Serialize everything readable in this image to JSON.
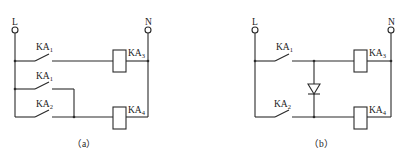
{
  "diagram": {
    "type": "relay-ladder-circuit",
    "colors": {
      "line": "#2a2a2a",
      "background": "#ffffff"
    },
    "panel_a": {
      "caption": "（a）",
      "terminals": {
        "left": "L",
        "right": "N"
      },
      "contacts": [
        {
          "name": "KA",
          "sub": "1",
          "type": "normally-open"
        },
        {
          "name": "KA",
          "sub": "1",
          "type": "normally-open"
        },
        {
          "name": "KA",
          "sub": "2",
          "type": "normally-open"
        }
      ],
      "coils": [
        {
          "name": "KA",
          "sub": "3"
        },
        {
          "name": "KA",
          "sub": "4"
        }
      ]
    },
    "panel_b": {
      "caption": "（b）",
      "terminals": {
        "left": "L",
        "right": "N"
      },
      "contacts": [
        {
          "name": "KA",
          "sub": "1",
          "type": "normally-open"
        },
        {
          "name": "KA",
          "sub": "2",
          "type": "normally-open"
        }
      ],
      "coils": [
        {
          "name": "KA",
          "sub": "3"
        },
        {
          "name": "KA",
          "sub": "4"
        }
      ],
      "diode": {
        "orientation": "anode-top-cathode-bottom"
      }
    }
  }
}
